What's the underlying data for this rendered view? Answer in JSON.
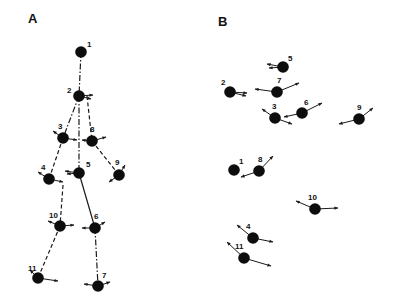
{
  "panels": [
    {
      "label": "A",
      "label_pos": [
        28,
        23
      ],
      "nodes": [
        {
          "id": "1",
          "x": 81,
          "y": 52,
          "lx": 6,
          "ly": -5,
          "arrows": []
        },
        {
          "id": "2",
          "x": 79,
          "y": 96,
          "lx": -12,
          "ly": -3,
          "arrows": [
            [
              14,
              -1
            ],
            [
              12,
              3
            ]
          ]
        },
        {
          "id": "3",
          "x": 63,
          "y": 138,
          "lx": -5,
          "ly": -9,
          "arrows": [
            [
              -10,
              -7
            ],
            [
              14,
              2
            ]
          ]
        },
        {
          "id": "8",
          "x": 92,
          "y": 141,
          "lx": -2,
          "ly": -9,
          "arrows": [
            [
              14,
              -4
            ],
            [
              -10,
              -1
            ]
          ]
        },
        {
          "id": "4",
          "x": 49,
          "y": 179,
          "lx": -8,
          "ly": -9,
          "arrows": [
            [
              -11,
              -7
            ],
            [
              14,
              3
            ]
          ]
        },
        {
          "id": "5",
          "x": 79,
          "y": 173,
          "lx": 7,
          "ly": -6,
          "arrows": [
            [
              -14,
              -2
            ],
            [
              -12,
              1
            ]
          ]
        },
        {
          "id": "9",
          "x": 119,
          "y": 175,
          "lx": -4,
          "ly": -10,
          "arrows": [
            [
              6,
              -10
            ],
            [
              -10,
              7
            ]
          ]
        },
        {
          "id": "10",
          "x": 60,
          "y": 226,
          "lx": -11,
          "ly": -8,
          "arrows": [
            [
              -12,
              -5
            ],
            [
              14,
              -1
            ]
          ]
        },
        {
          "id": "6",
          "x": 95,
          "y": 228,
          "lx": -1,
          "ly": -9,
          "arrows": [
            [
              10,
              -6
            ],
            [
              -13,
              0
            ]
          ]
        },
        {
          "id": "11",
          "x": 38,
          "y": 278,
          "lx": -10,
          "ly": -7,
          "arrows": [
            [
              -8,
              -8
            ],
            [
              20,
              3
            ]
          ]
        },
        {
          "id": "7",
          "x": 98,
          "y": 286,
          "lx": 4,
          "ly": -8,
          "arrows": [
            [
              12,
              -4
            ],
            [
              -14,
              -2
            ]
          ]
        }
      ],
      "edges": [
        {
          "from": "1",
          "to": "2",
          "style": "dashdot"
        },
        {
          "from": "2",
          "to": "3",
          "style": "dashdot"
        },
        {
          "from": "2",
          "to": "5",
          "style": "dashdot"
        },
        {
          "from": "2",
          "to": "8",
          "style": "dashed",
          "offset": [
            8,
            0
          ]
        },
        {
          "from": "3",
          "to": "4",
          "style": "dashed"
        },
        {
          "from": "8",
          "to": "9",
          "style": "dashed"
        },
        {
          "from": "5",
          "to": "6",
          "style": "solid"
        },
        {
          "from": "4",
          "to": "10",
          "style": "dashed",
          "offset": [
            14,
            6
          ]
        },
        {
          "from": "10",
          "to": "11",
          "style": "dashed"
        },
        {
          "from": "6",
          "to": "7",
          "style": "dashdot"
        }
      ]
    },
    {
      "label": "B",
      "label_pos": [
        218,
        26
      ],
      "nodes": [
        {
          "id": "5",
          "x": 283,
          "y": 67,
          "lx": 5,
          "ly": -6,
          "arrows": [
            [
              -16,
              -3
            ],
            [
              -14,
              1
            ]
          ]
        },
        {
          "id": "2",
          "x": 230,
          "y": 92,
          "lx": -9,
          "ly": -7,
          "arrows": [
            [
              17,
              1
            ],
            [
              16,
              4
            ]
          ]
        },
        {
          "id": "7",
          "x": 277,
          "y": 92,
          "lx": 0,
          "ly": -9,
          "arrows": [
            [
              22,
              -9
            ],
            [
              -22,
              -3
            ]
          ]
        },
        {
          "id": "3",
          "x": 275,
          "y": 118,
          "lx": -3,
          "ly": -9,
          "arrows": [
            [
              -13,
              -9
            ],
            [
              17,
              6
            ]
          ]
        },
        {
          "id": "6",
          "x": 302,
          "y": 113,
          "lx": 2,
          "ly": -8,
          "arrows": [
            [
              20,
              -10
            ],
            [
              -18,
              4
            ]
          ]
        },
        {
          "id": "9",
          "x": 359,
          "y": 119,
          "lx": -2,
          "ly": -9,
          "arrows": [
            [
              14,
              -11
            ],
            [
              -20,
              5
            ]
          ]
        },
        {
          "id": "1",
          "x": 234,
          "y": 170,
          "lx": 5,
          "ly": -6,
          "arrows": []
        },
        {
          "id": "8",
          "x": 259,
          "y": 171,
          "lx": -1,
          "ly": -9,
          "arrows": [
            [
              14,
              -15
            ],
            [
              -18,
              6
            ]
          ]
        },
        {
          "id": "10",
          "x": 315,
          "y": 209,
          "lx": -7,
          "ly": -9,
          "arrows": [
            [
              -19,
              -8
            ],
            [
              23,
              -1
            ]
          ]
        },
        {
          "id": "4",
          "x": 253,
          "y": 238,
          "lx": -7,
          "ly": -9,
          "arrows": [
            [
              -16,
              -13
            ],
            [
              20,
              4
            ]
          ]
        },
        {
          "id": "11",
          "x": 244,
          "y": 258,
          "lx": -9,
          "ly": -9,
          "arrows": [
            [
              -17,
              -16
            ],
            [
              27,
              8
            ]
          ]
        }
      ],
      "edges": []
    }
  ],
  "colors": {
    "node": "#0d0d0d",
    "line": "#1a1a1a",
    "background": "#ffffff"
  }
}
